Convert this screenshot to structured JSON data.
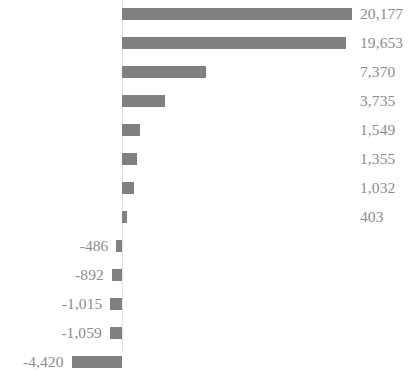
{
  "chart_data": {
    "type": "bar",
    "orientation": "horizontal",
    "title": "",
    "subtitle": "",
    "xlabel": "",
    "ylabel": "",
    "grid": false,
    "legend": null,
    "legend_position": "none",
    "axis_ticks": [],
    "categories": [
      "",
      "",
      "",
      "",
      "",
      "",
      "",
      "",
      "",
      "",
      "",
      "",
      ""
    ],
    "values": [
      20177,
      19653,
      7370,
      3735,
      1549,
      1355,
      1032,
      403,
      -486,
      -892,
      -1015,
      -1059,
      -4420
    ],
    "data_labels": [
      "20,177",
      "19,653",
      "7,370",
      "3,735",
      "1,549",
      "1,355",
      "1,032",
      "403",
      "-486",
      "-892",
      "-1,015",
      "-1,059",
      "-4,420"
    ],
    "xlim": [
      -4420,
      20177
    ],
    "zero_line": true,
    "bar_color": "#808080",
    "label_color": "#8c8c8c",
    "axis_line_color": "#e2e2e2",
    "background_color": "#ffffff"
  },
  "bars": [
    {
      "label": "20,177",
      "value": 20177,
      "sign": "pos"
    },
    {
      "label": "19,653",
      "value": 19653,
      "sign": "pos"
    },
    {
      "label": "7,370",
      "value": 7370,
      "sign": "pos"
    },
    {
      "label": "3,735",
      "value": 3735,
      "sign": "pos"
    },
    {
      "label": "1,549",
      "value": 1549,
      "sign": "pos"
    },
    {
      "label": "1,355",
      "value": 1355,
      "sign": "pos"
    },
    {
      "label": "1,032",
      "value": 1032,
      "sign": "pos"
    },
    {
      "label": "403",
      "value": 403,
      "sign": "pos"
    },
    {
      "label": "-486",
      "value": -486,
      "sign": "neg"
    },
    {
      "label": "-892",
      "value": -892,
      "sign": "neg"
    },
    {
      "label": "-1,015",
      "value": -1015,
      "sign": "neg"
    },
    {
      "label": "-1,059",
      "value": -1059,
      "sign": "neg"
    },
    {
      "label": "-4,420",
      "value": -4420,
      "sign": "neg"
    }
  ]
}
